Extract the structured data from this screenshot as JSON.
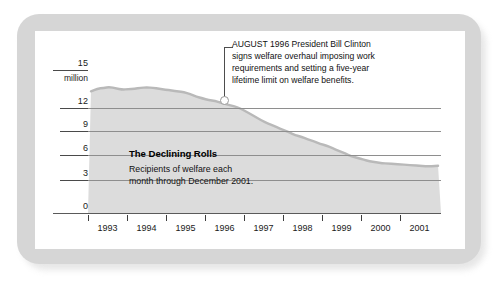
{
  "chart_data": {
    "type": "area",
    "title": "The Declining Rolls",
    "subtitle": "Recipients of welfare each month through December 2001.",
    "xlabel": "",
    "ylabel": "million",
    "ylim": [
      0,
      15
    ],
    "xlim": [
      1992.5,
      2002.0
    ],
    "grid": true,
    "legend_position": "none",
    "y_ticks": [
      "15",
      "12",
      "9",
      "6",
      "3",
      "0"
    ],
    "y_tick_values": [
      15,
      12,
      9,
      6,
      3,
      0
    ],
    "y_unit_label": "million",
    "x_ticks": [
      "1993",
      "1994",
      "1995",
      "1996",
      "1997",
      "1998",
      "1999",
      "2000",
      "2001"
    ],
    "x_tick_values": [
      1993,
      1994,
      1995,
      1996,
      1997,
      1998,
      1999,
      2000,
      2001
    ],
    "series": [
      {
        "name": "Welfare recipients",
        "x": [
          1992.58,
          1992.75,
          1992.92,
          1993.08,
          1993.25,
          1993.42,
          1993.58,
          1993.75,
          1993.92,
          1994.08,
          1994.25,
          1994.42,
          1994.58,
          1994.75,
          1994.92,
          1995.08,
          1995.25,
          1995.42,
          1995.58,
          1995.75,
          1995.92,
          1996.08,
          1996.25,
          1996.42,
          1996.58,
          1996.75,
          1996.92,
          1997.08,
          1997.25,
          1997.42,
          1997.58,
          1997.75,
          1997.92,
          1998.08,
          1998.25,
          1998.42,
          1998.58,
          1998.75,
          1998.92,
          1999.08,
          1999.25,
          1999.42,
          1999.58,
          1999.75,
          1999.92,
          2000.08,
          2000.25,
          2000.42,
          2000.58,
          2000.75,
          2000.92,
          2001.08,
          2001.25,
          2001.42,
          2001.58,
          2001.75,
          2001.92
        ],
        "values": [
          13.9,
          14.2,
          14.3,
          14.4,
          14.25,
          14.1,
          14.15,
          14.2,
          14.3,
          14.35,
          14.3,
          14.2,
          14.1,
          14.0,
          13.9,
          13.8,
          13.6,
          13.3,
          13.1,
          12.9,
          12.8,
          12.6,
          12.4,
          12.2,
          12.0,
          11.6,
          11.2,
          10.8,
          10.4,
          10.1,
          9.8,
          9.5,
          9.2,
          8.9,
          8.7,
          8.4,
          8.2,
          7.9,
          7.7,
          7.4,
          7.1,
          6.8,
          6.5,
          6.3,
          6.1,
          5.9,
          5.8,
          5.7,
          5.65,
          5.6,
          5.55,
          5.5,
          5.45,
          5.4,
          5.35,
          5.35,
          5.4
        ]
      }
    ],
    "annotations": [
      {
        "name": "clinton-welfare-reform",
        "text": "AUGUST 1996 President Bill Clinton signs welfare overhaul imposing work requirements and setting a five-year lifetime limit on welfare benefits.",
        "point_x": 1996.58,
        "point_y": 12.0
      }
    ],
    "colors": {
      "area_fill": "#dcdcdc",
      "line": "#b4b4b4",
      "grid": "#8e8e8e",
      "frame": "#d6d6d6",
      "text": "#111111"
    }
  },
  "annotation": {
    "line1": "AUGUST 1996 President Bill Clinton",
    "line2": "signs welfare overhaul imposing work",
    "line3": "requirements and setting a five-year",
    "line4": "lifetime limit on welfare benefits."
  },
  "caption": {
    "title": "The Declining Rolls",
    "line1": "Recipients of welfare each",
    "line2": "month through December 2001."
  },
  "axis": {
    "y": {
      "t0": "15",
      "unit": "million",
      "t1": "12",
      "t2": "9",
      "t3": "6",
      "t4": "3",
      "t5": "0"
    },
    "x": {
      "y1993": "1993",
      "y1994": "1994",
      "y1995": "1995",
      "y1996": "1996",
      "y1997": "1997",
      "y1998": "1998",
      "y1999": "1999",
      "y2000": "2000",
      "y2001": "2001"
    }
  }
}
